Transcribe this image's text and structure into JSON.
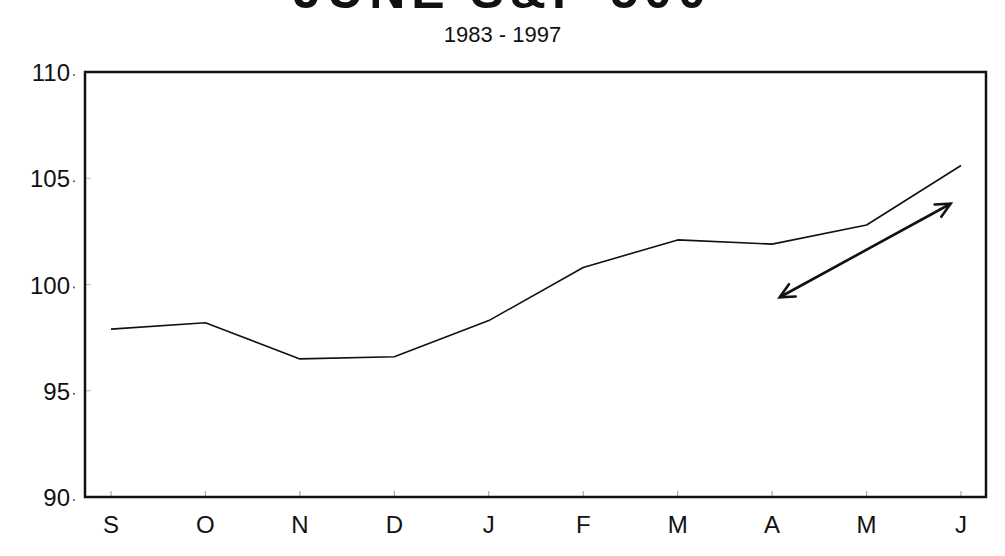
{
  "chart_data": {
    "type": "line",
    "title": "JUNE S&P 500",
    "subtitle": "1983 - 1997",
    "xlabel": "",
    "ylabel": "",
    "categories": [
      "S",
      "O",
      "N",
      "D",
      "J",
      "F",
      "M",
      "A",
      "M",
      "J"
    ],
    "series": [
      {
        "name": "S&P 500 seasonal pattern",
        "values": [
          97.9,
          98.2,
          96.5,
          96.6,
          98.3,
          100.8,
          102.1,
          101.9,
          102.8,
          105.6
        ]
      }
    ],
    "ylim": [
      90,
      110
    ],
    "yticks": [
      90,
      95,
      100,
      105,
      110
    ],
    "ytick_labels": [
      "90",
      "95",
      "100",
      "105",
      "110"
    ],
    "grid": false,
    "legend": null,
    "annotations": [
      {
        "type": "double-arrow",
        "from": {
          "x_index": 7.08,
          "y": 99.4
        },
        "to": {
          "x_index": 8.89,
          "y": 103.8
        }
      }
    ]
  },
  "colors": {
    "line": "#111111",
    "axis": "#111111",
    "background": "#ffffff"
  }
}
